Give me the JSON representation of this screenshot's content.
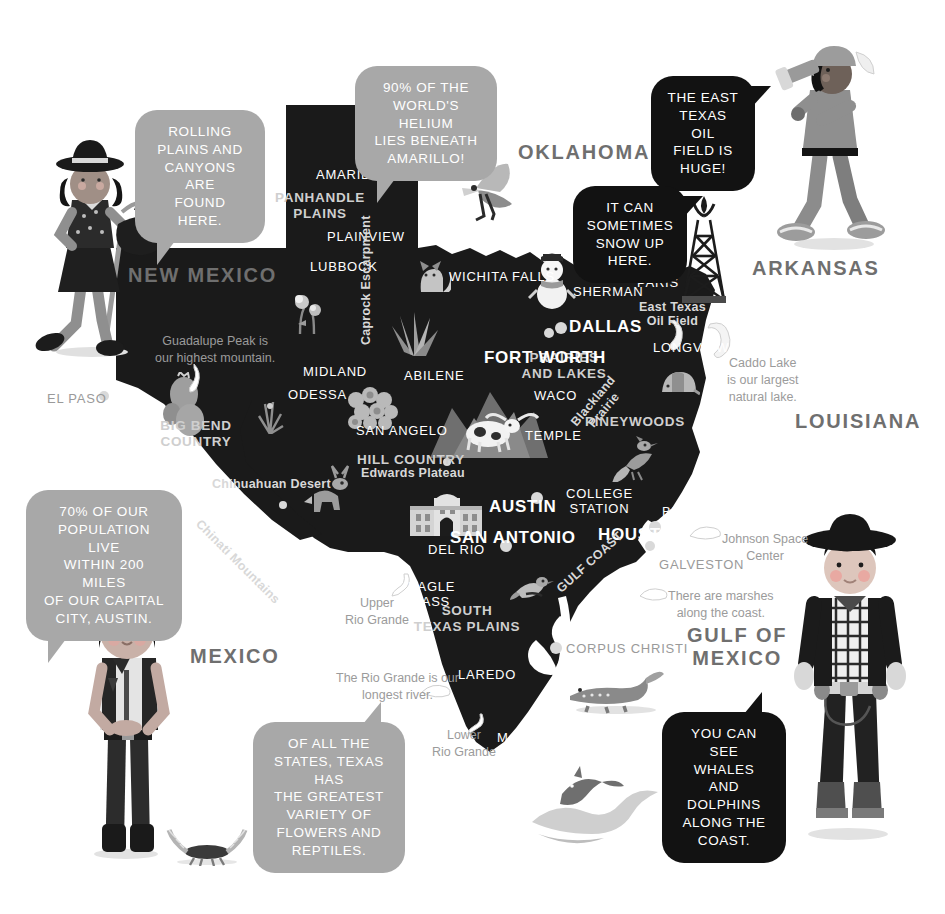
{
  "colors": {
    "background": "#ffffff",
    "map_fill": "#1a1a1a",
    "bubble_grey": "#a8a8a8",
    "bubble_dark": "#121212",
    "label_white": "#ffffff",
    "label_grey": "#cfcfcf",
    "note_grey": "#9b9b9b",
    "state_name_grey": "#6f6f6f",
    "faded_city": "#9a9a9a",
    "illustration_grey": "#8e8e8e"
  },
  "speech_bubbles": [
    {
      "id": "rolling-plains",
      "style": "grey",
      "text": "ROLLING\nPLAINS AND\nCANYONS ARE\nFOUND HERE.",
      "x": 135,
      "y": 110,
      "w": 130,
      "h": 84
    },
    {
      "id": "helium",
      "style": "grey",
      "text": "90% OF THE\nWORLD'S HELIUM\nLIES BENEATH\nAMARILLO!",
      "x": 355,
      "y": 66,
      "w": 142,
      "h": 84
    },
    {
      "id": "east-texas-oil",
      "style": "dark",
      "text": "THE EAST\nTEXAS OIL\nFIELD IS\nHUGE!",
      "x": 651,
      "y": 76,
      "w": 104,
      "h": 84
    },
    {
      "id": "snow",
      "style": "dark",
      "text": "IT CAN\nSOMETIMES\nSNOW UP\nHERE.",
      "x": 573,
      "y": 186,
      "w": 114,
      "h": 82
    },
    {
      "id": "population",
      "style": "grey",
      "text": "70% OF OUR\nPOPULATION LIVE\nWITHIN 200 MILES\nOF OUR CAPITAL\nCITY, AUSTIN.",
      "x": 26,
      "y": 490,
      "w": 156,
      "h": 100
    },
    {
      "id": "flowers-reptiles",
      "style": "grey",
      "text": "OF ALL THE\nSTATES, TEXAS HAS\nTHE GREATEST\nVARIETY OF\nFLOWERS AND\nREPTILES.",
      "x": 253,
      "y": 722,
      "w": 152,
      "h": 114
    },
    {
      "id": "whales-dolphins",
      "style": "dark",
      "text": "YOU CAN SEE\nWHALES AND\nDOLPHINS\nALONG THE\nCOAST.",
      "x": 662,
      "y": 712,
      "w": 124,
      "h": 98
    }
  ],
  "neighbor_states": [
    {
      "name": "NEW MEXICO",
      "x": 128,
      "y": 264
    },
    {
      "name": "OKLAHOMA",
      "x": 518,
      "y": 141
    },
    {
      "name": "ARKANSAS",
      "x": 752,
      "y": 257
    },
    {
      "name": "LOUISIANA",
      "x": 795,
      "y": 410
    },
    {
      "name": "MEXICO",
      "x": 190,
      "y": 645
    },
    {
      "name": "GULF OF\nMEXICO",
      "x": 687,
      "y": 624
    }
  ],
  "cities": [
    {
      "name": "AMARILLO",
      "x": 316,
      "y": 168,
      "size": "city"
    },
    {
      "name": "PLAINVIEW",
      "x": 327,
      "y": 230,
      "size": "city"
    },
    {
      "name": "LUBBOCK",
      "x": 310,
      "y": 260,
      "size": "city"
    },
    {
      "name": "WICHITA FALLS",
      "x": 449,
      "y": 270,
      "size": "city"
    },
    {
      "name": "SHERMAN",
      "x": 573,
      "y": 285,
      "size": "city"
    },
    {
      "name": "PARIS",
      "x": 637,
      "y": 276,
      "size": "city"
    },
    {
      "name": "DALLAS",
      "x": 569,
      "y": 317,
      "size": "bigcity"
    },
    {
      "name": "FORT WORTH",
      "x": 484,
      "y": 348,
      "size": "bigcity"
    },
    {
      "name": "LONGVIEW",
      "x": 653,
      "y": 341,
      "size": "city"
    },
    {
      "name": "MIDLAND",
      "x": 303,
      "y": 365,
      "size": "city"
    },
    {
      "name": "ABILENE",
      "x": 404,
      "y": 369,
      "size": "city"
    },
    {
      "name": "ODESSA",
      "x": 288,
      "y": 388,
      "size": "city"
    },
    {
      "name": "WACO",
      "x": 534,
      "y": 389,
      "size": "city"
    },
    {
      "name": "SAN ANGELO",
      "x": 356,
      "y": 424,
      "size": "city"
    },
    {
      "name": "TEMPLE",
      "x": 525,
      "y": 429,
      "size": "city"
    },
    {
      "name": "AUSTIN",
      "x": 489,
      "y": 497,
      "size": "bigcity"
    },
    {
      "name": "SAN ANTONIO",
      "x": 450,
      "y": 528,
      "size": "bigcity"
    },
    {
      "name": "HOUSTON",
      "x": 598,
      "y": 525,
      "size": "bigcity"
    },
    {
      "name": "BEAUMONT",
      "x": 662,
      "y": 505,
      "size": "city"
    },
    {
      "name": "DEL RIO",
      "x": 428,
      "y": 543,
      "size": "city"
    },
    {
      "name": "EAGLE\nPASS",
      "x": 408,
      "y": 580,
      "size": "city"
    },
    {
      "name": "LAREDO",
      "x": 458,
      "y": 668,
      "size": "city"
    },
    {
      "name": "McALLEN",
      "x": 497,
      "y": 731,
      "size": "city"
    },
    {
      "name": "COLLEGE\nSTATION",
      "x": 566,
      "y": 487,
      "size": "city"
    },
    {
      "name": "EL PASO",
      "x": 47,
      "y": 392,
      "size": "city",
      "faded": true
    },
    {
      "name": "GALVESTON",
      "x": 659,
      "y": 558,
      "size": "city",
      "faded": true
    },
    {
      "name": "CORPUS CHRISTI",
      "x": 566,
      "y": 642,
      "size": "city",
      "faded": true
    }
  ],
  "regions": [
    {
      "name": "PANHANDLE\nPLAINS",
      "x": 320,
      "y": 190
    },
    {
      "name": "PRAIRIES\nAND LAKES",
      "x": 564,
      "y": 350
    },
    {
      "name": "BIG BEND\nCOUNTRY",
      "x": 196,
      "y": 418
    },
    {
      "name": "PINEYWOODS",
      "x": 635,
      "y": 414
    },
    {
      "name": "HILL COUNTRY",
      "x": 411,
      "y": 452
    },
    {
      "name": "SOUTH\nTEXAS PLAINS",
      "x": 467,
      "y": 603
    }
  ],
  "sub_labels": [
    {
      "name": "Caprock Escarpment",
      "x": 359,
      "y": 345,
      "rotate": "vertical"
    },
    {
      "name": "East Texas\nOil Field",
      "x": 639,
      "y": 300
    },
    {
      "name": "Edwards Plateau",
      "x": 361,
      "y": 466
    },
    {
      "name": "Chihuahuan Desert",
      "x": 212,
      "y": 477
    },
    {
      "name": "Chinati Mountains",
      "x": 203,
      "y": 517,
      "rotate": "diagonal-down"
    },
    {
      "name": "Blackland\nPrairie",
      "x": 568,
      "y": 420,
      "rotate": "diagonal-up"
    },
    {
      "name": "GULF COAST",
      "x": 554,
      "y": 585,
      "rotate": "diagonal-coast"
    }
  ],
  "notes": [
    {
      "text": "Guadalupe Peak is\nour highest mountain.",
      "x": 155,
      "y": 333,
      "align": "center"
    },
    {
      "text": "Caddo Lake\nis our largest\nnatural lake.",
      "x": 727,
      "y": 355,
      "align": "center"
    },
    {
      "text": "Johnson Space\nCenter",
      "x": 722,
      "y": 531,
      "align": "center"
    },
    {
      "text": "There are marshes\nalong the coast.",
      "x": 668,
      "y": 588,
      "align": "center"
    },
    {
      "text": "Upper\nRio Grande",
      "x": 345,
      "y": 595,
      "align": "center"
    },
    {
      "text": "The Rio Grande is our\nlongest river.",
      "x": 336,
      "y": 670,
      "align": "center"
    },
    {
      "text": "Lower\nRio Grande",
      "x": 432,
      "y": 727,
      "align": "center"
    }
  ],
  "city_dots": [
    {
      "x": 549,
      "y": 333,
      "r": 5
    },
    {
      "x": 561,
      "y": 328,
      "r": 6
    },
    {
      "x": 537,
      "y": 498,
      "r": 6
    },
    {
      "x": 506,
      "y": 546,
      "r": 6
    },
    {
      "x": 655,
      "y": 527,
      "r": 6
    },
    {
      "x": 556,
      "y": 648,
      "r": 6
    },
    {
      "x": 104,
      "y": 396,
      "r": 5
    },
    {
      "x": 283,
      "y": 505,
      "r": 4
    },
    {
      "x": 447,
      "y": 462,
      "r": 4
    },
    {
      "x": 650,
      "y": 546,
      "r": 5
    }
  ],
  "illustrations": [
    {
      "name": "cowgirl-on-hobby-horse",
      "x": 14,
      "y": 128
    },
    {
      "name": "boy-with-telescope",
      "x": 762,
      "y": 44
    },
    {
      "name": "girl-in-vest",
      "x": 72,
      "y": 596
    },
    {
      "name": "cowboy-with-hat",
      "x": 782,
      "y": 512
    },
    {
      "name": "flying-bird",
      "x": 458,
      "y": 160
    },
    {
      "name": "snowman",
      "x": 528,
      "y": 248
    },
    {
      "name": "oil-derrick",
      "x": 680,
      "y": 196
    },
    {
      "name": "fox",
      "x": 415,
      "y": 258
    },
    {
      "name": "agave-plant",
      "x": 388,
      "y": 310
    },
    {
      "name": "cactus-cluster",
      "x": 160,
      "y": 372
    },
    {
      "name": "cotton-bolls",
      "x": 342,
      "y": 386
    },
    {
      "name": "longhorn-cattle",
      "x": 440,
      "y": 398
    },
    {
      "name": "deer",
      "x": 305,
      "y": 466
    },
    {
      "name": "roadrunner",
      "x": 615,
      "y": 440
    },
    {
      "name": "armadillo",
      "x": 663,
      "y": 368
    },
    {
      "name": "alamo-building",
      "x": 412,
      "y": 497
    },
    {
      "name": "mockingbird",
      "x": 512,
      "y": 570
    },
    {
      "name": "alligator",
      "x": 570,
      "y": 672
    },
    {
      "name": "dolphin-and-wave",
      "x": 535,
      "y": 768
    },
    {
      "name": "scorpion",
      "x": 165,
      "y": 832
    },
    {
      "name": "bluebonnet-flowers",
      "x": 288,
      "y": 290
    },
    {
      "name": "yucca-plant",
      "x": 255,
      "y": 396
    }
  ]
}
